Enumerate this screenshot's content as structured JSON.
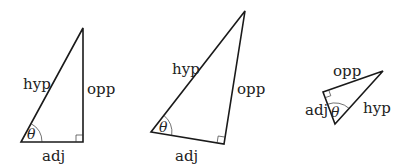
{
  "figure": {
    "colors": {
      "stroke": "#1a1a1a",
      "text": "#222222",
      "background": "#ffffff"
    },
    "triangles": [
      {
        "id": "triangle-1",
        "orientation": "upright",
        "labels": {
          "hypotenuse": "hyp",
          "opposite": "opp",
          "adjacent": "adj",
          "angle": "θ"
        }
      },
      {
        "id": "triangle-2",
        "orientation": "tilted",
        "labels": {
          "hypotenuse": "hyp",
          "opposite": "opp",
          "adjacent": "adj",
          "angle": "θ"
        }
      },
      {
        "id": "triangle-3",
        "orientation": "rotated",
        "labels": {
          "hypotenuse": "hyp",
          "opposite": "opp",
          "adjacent": "adj",
          "angle": "θ"
        }
      }
    ]
  }
}
